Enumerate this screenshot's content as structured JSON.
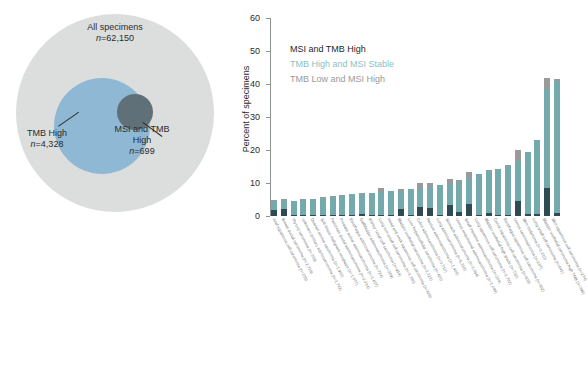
{
  "venn": {
    "outer": {
      "title": "All specimens",
      "n_prefix": "n",
      "n_value": "=62,150"
    },
    "tmb": {
      "title": "TMB High",
      "n_prefix": "n",
      "n_value": "=4,328"
    },
    "msi": {
      "title": "MSI and TMB",
      "title2": "High",
      "n_prefix": "n",
      "n_value": "=699"
    },
    "colors": {
      "outer": "#dcdedd",
      "tmb_high": "#8fb8d5",
      "msi_tmb_high": "#5f7078"
    }
  },
  "chart_data": {
    "type": "bar",
    "stacked": true,
    "title": "",
    "xlabel": "",
    "ylabel": "Percent of specimens",
    "ylim": [
      0,
      60
    ],
    "yticks": [
      0,
      10,
      20,
      30,
      40,
      50,
      60
    ],
    "grid": false,
    "legend_position": "top-left",
    "note": "Last bar extends above the 60 axis maximum and is clipped at the top of the figure.",
    "legend": [
      {
        "name": "MSI and TMB High",
        "color": "#2e4a52"
      },
      {
        "name": "TMB High and MSI Stable",
        "color": "#74aaad"
      },
      {
        "name": "TMB Low and MSI High",
        "color": "#9a9a98"
      }
    ],
    "categories": [
      "Anal squamous cell carcinoma (n=215)",
      "Breast ductal carcinoma (n=2,719)",
      "Thyroid carcinoma (n=319)",
      "Unknown primary adenocarcinoma (n=1,742)",
      "Ovarian serous carcinoma (n=1,902)",
      "Soft tissue malignant neoplasm (n=1,077)",
      "Pancreas ductal adenocarcinoma (n=2,214)",
      "Prostate acinar adenocarcinoma (n=1,437)",
      "Esophagus adenocarcinoma (n=724)",
      "Gallbladder adenocarcinoma (n=309)",
      "Kidney renal cell carcinoma (n=954)",
      "Lung non-small cell carcinoma (n=1,380)",
      "Head and neck squamous cell carcinoma (n=826)",
      "Bladder urothelial carcinoma (n=1,121)",
      "Liver hepatocellular carcinoma (n=421)",
      "Colon adenocarcinoma (n=3,712)",
      "Rectum adenocarcinoma (n=1,408)",
      "Lung adenocarcinoma (n=5,318)",
      "Stomach adenocarcinoma (n=1,094)",
      "Uterus endometrial adenocarcinoma (n=1,246)",
      "Small intestine adenocarcinoma (n=304)",
      "Lung squamous cell carcinoma (n=1,782)",
      "Bladder urothelial high grade (n=732)",
      "Cervix squamous cell carcinoma (n=508)",
      "Esophagus squamous cell carcinoma (n=362)",
      "Uterus carcinosarcoma (n=287)",
      "Skin melanoma (n=1,210)",
      "Lung small cell carcinoma (n=641)",
      "Bladder urothelial carcinoma high TMB (n=396)",
      "Skin squamous cell carcinoma (n=274)"
    ],
    "series": [
      {
        "name": "MSI and TMB High",
        "color": "#2e4a52",
        "values": [
          1.7,
          2.0,
          0.2,
          0.2,
          0.2,
          0.2,
          0.3,
          0.2,
          0.3,
          0.6,
          0.2,
          0.3,
          0.2,
          2.1,
          0.2,
          2.8,
          2.4,
          0.3,
          3.4,
          1.2,
          3.6,
          0.3,
          0.9,
          0.4,
          0.3,
          4.6,
          0.5,
          0.6,
          8.4,
          1.0
        ]
      },
      {
        "name": "TMB High and MSI Stable",
        "color": "#74aaad",
        "values": [
          2.9,
          2.8,
          4.4,
          4.8,
          5.0,
          5.4,
          5.6,
          6.0,
          6.3,
          6.1,
          6.8,
          7.0,
          7.4,
          5.6,
          7.9,
          5.6,
          6.3,
          9.0,
          6.4,
          9.1,
          8.0,
          12.4,
          12.6,
          13.8,
          15.0,
          12.2,
          18.8,
          22.3,
          30.1,
          40.0
        ]
      },
      {
        "name": "TMB Low and MSI High",
        "color": "#9a9a98",
        "values": [
          0.2,
          0.3,
          0.1,
          0.1,
          0.1,
          0.1,
          0.1,
          0.1,
          0.1,
          0.3,
          0.1,
          1.1,
          0.1,
          0.5,
          0.1,
          1.5,
          1.2,
          0.1,
          1.4,
          0.7,
          1.6,
          0.1,
          0.3,
          0.2,
          0.1,
          3.2,
          0.2,
          0.2,
          3.4,
          0.4
        ]
      }
    ]
  }
}
